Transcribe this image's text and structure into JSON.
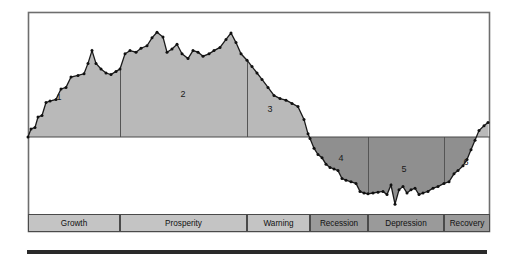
{
  "figure": {
    "name": "business-cycle-diagram",
    "frame": {
      "x": 28,
      "y": 12,
      "width": 462,
      "height": 220,
      "border_color": "#6e6e6e",
      "background": "#ffffff"
    },
    "zero_line_y": 137,
    "colors": {
      "expansion_fill": "#b9b9b9",
      "contraction_fill": "#8f8f8f",
      "line_color": "#1a1a1a",
      "marker_color": "#111111",
      "frame_border": "#6e6e6e",
      "divider": "#555555",
      "legend_light": "#c4c4c4",
      "legend_dark": "#9a9a9a",
      "legend_border": "#4a4a4a",
      "bottom_bar": "#2a2a2a"
    },
    "legend_band": {
      "y": 214,
      "height": 18,
      "cells": [
        {
          "label": "Growth",
          "x": 28,
          "width": 92,
          "tone": "light",
          "phase": 1
        },
        {
          "label": "Prosperity",
          "x": 120,
          "width": 127,
          "tone": "light",
          "phase": 2
        },
        {
          "label": "Warning",
          "x": 247,
          "width": 63,
          "tone": "light",
          "phase": 3
        },
        {
          "label": "Recession",
          "x": 310,
          "width": 58,
          "tone": "dark",
          "phase": 4
        },
        {
          "label": "Depression",
          "x": 368,
          "width": 76,
          "tone": "dark",
          "phase": 5
        },
        {
          "label": "Recovery",
          "x": 444,
          "width": 46,
          "tone": "dark",
          "phase": 6
        }
      ]
    },
    "phase_markers": [
      {
        "number": "1",
        "x": 59,
        "y": 98
      },
      {
        "number": "2",
        "x": 183,
        "y": 95
      },
      {
        "number": "3",
        "x": 270,
        "y": 110
      },
      {
        "number": "4",
        "x": 341,
        "y": 159
      },
      {
        "number": "5",
        "x": 404,
        "y": 170
      },
      {
        "number": "6",
        "x": 466,
        "y": 163
      }
    ],
    "dividers_x": [
      120,
      247,
      310,
      368,
      444
    ],
    "bottom_bar": {
      "x": 27,
      "y": 250,
      "width": 460,
      "height": 4
    }
  },
  "chart_data": {
    "type": "area",
    "subtitle": "",
    "xlabel": "",
    "ylabel": "",
    "grid": false,
    "legend_position": "bottom",
    "zero_line": 0,
    "axis_note": "Vertical axis is unlabeled relative economic activity; horizontal axis is unlabeled time.",
    "phases": [
      {
        "number": 1,
        "label": "Growth",
        "sign": "positive"
      },
      {
        "number": 2,
        "label": "Prosperity",
        "sign": "positive"
      },
      {
        "number": 3,
        "label": "Warning",
        "sign": "positive"
      },
      {
        "number": 4,
        "label": "Recession",
        "sign": "negative"
      },
      {
        "number": 5,
        "label": "Depression",
        "sign": "negative"
      },
      {
        "number": 6,
        "label": "Recovery",
        "sign": "negative"
      }
    ],
    "series": [
      {
        "name": "Economic activity",
        "points": [
          [
            28,
            0
          ],
          [
            31,
            10
          ],
          [
            35,
            12
          ],
          [
            38,
            25
          ],
          [
            42,
            27
          ],
          [
            46,
            43
          ],
          [
            50,
            45
          ],
          [
            56,
            47
          ],
          [
            61,
            60
          ],
          [
            66,
            62
          ],
          [
            71,
            75
          ],
          [
            78,
            77
          ],
          [
            84,
            79
          ],
          [
            88,
            92
          ],
          [
            92,
            108
          ],
          [
            96,
            92
          ],
          [
            101,
            85
          ],
          [
            106,
            80
          ],
          [
            111,
            78
          ],
          [
            116,
            82
          ],
          [
            120,
            85
          ],
          [
            125,
            104
          ],
          [
            130,
            108
          ],
          [
            136,
            106
          ],
          [
            141,
            111
          ],
          [
            147,
            114
          ],
          [
            152,
            124
          ],
          [
            157,
            131
          ],
          [
            163,
            125
          ],
          [
            167,
            106
          ],
          [
            172,
            110
          ],
          [
            177,
            116
          ],
          [
            182,
            104
          ],
          [
            188,
            98
          ],
          [
            193,
            108
          ],
          [
            198,
            106
          ],
          [
            203,
            101
          ],
          [
            209,
            104
          ],
          [
            214,
            108
          ],
          [
            220,
            112
          ],
          [
            226,
            122
          ],
          [
            231,
            130
          ],
          [
            236,
            118
          ],
          [
            241,
            104
          ],
          [
            247,
            96
          ],
          [
            252,
            88
          ],
          [
            257,
            80
          ],
          [
            262,
            72
          ],
          [
            268,
            62
          ],
          [
            274,
            52
          ],
          [
            280,
            48
          ],
          [
            286,
            46
          ],
          [
            292,
            42
          ],
          [
            298,
            38
          ],
          [
            304,
            22
          ],
          [
            308,
            4
          ],
          [
            310,
            -2
          ],
          [
            314,
            -14
          ],
          [
            318,
            -22
          ],
          [
            322,
            -26
          ],
          [
            326,
            -34
          ],
          [
            330,
            -38
          ],
          [
            334,
            -40
          ],
          [
            338,
            -42
          ],
          [
            342,
            -52
          ],
          [
            346,
            -54
          ],
          [
            351,
            -56
          ],
          [
            356,
            -58
          ],
          [
            360,
            -68
          ],
          [
            364,
            -70
          ],
          [
            368,
            -71
          ],
          [
            373,
            -70
          ],
          [
            378,
            -69
          ],
          [
            383,
            -68
          ],
          [
            387,
            -72
          ],
          [
            391,
            -60
          ],
          [
            395,
            -84
          ],
          [
            399,
            -66
          ],
          [
            403,
            -62
          ],
          [
            407,
            -70
          ],
          [
            411,
            -66
          ],
          [
            415,
            -64
          ],
          [
            419,
            -72
          ],
          [
            423,
            -70
          ],
          [
            428,
            -68
          ],
          [
            433,
            -64
          ],
          [
            438,
            -62
          ],
          [
            444,
            -58
          ],
          [
            449,
            -56
          ],
          [
            454,
            -46
          ],
          [
            458,
            -42
          ],
          [
            463,
            -36
          ],
          [
            467,
            -28
          ],
          [
            471,
            -16
          ],
          [
            475,
            -4
          ],
          [
            479,
            8
          ],
          [
            484,
            14
          ],
          [
            488,
            18
          ]
        ],
        "note": "x values are pixel positions across the plot frame; y values are relative units above/below the zero line (positive = expansion shading, negative = contraction shading)."
      }
    ]
  }
}
